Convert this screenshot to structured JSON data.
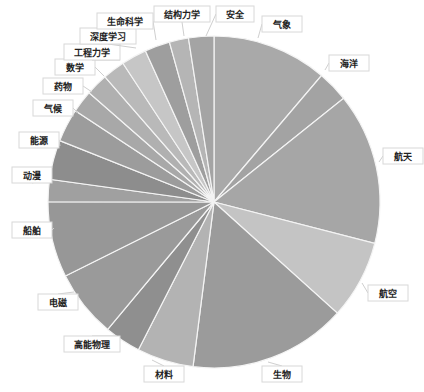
{
  "chart_data": {
    "type": "pie",
    "title": "",
    "start_angle_deg": 0,
    "direction": "clockwise",
    "legend": "none (callout labels)",
    "slices": [
      {
        "label": "气象",
        "value": 11.4,
        "color": "#a9a9a9"
      },
      {
        "label": "海洋",
        "value": 3.1,
        "color": "#a3a3a3"
      },
      {
        "label": "航天",
        "value": 15.0,
        "color": "#a6a6a6"
      },
      {
        "label": "航空",
        "value": 7.8,
        "color": "#c4c4c4"
      },
      {
        "label": "生物",
        "value": 15.6,
        "color": "#9b9b9b"
      },
      {
        "label": "材料",
        "value": 5.6,
        "color": "#b3b3b3"
      },
      {
        "label": "高能物理",
        "value": 3.6,
        "color": "#8f8f8f"
      },
      {
        "label": "电磁",
        "value": 6.7,
        "color": "#9a9a9a"
      },
      {
        "label": "船舶",
        "value": 7.5,
        "color": "#979797"
      },
      {
        "label": "动漫",
        "value": 2.2,
        "color": "#a0a0a0"
      },
      {
        "label": "能源",
        "value": 3.9,
        "color": "#8d8d8d"
      },
      {
        "label": "气候",
        "value": 3.3,
        "color": "#9c9c9c"
      },
      {
        "label": "药物",
        "value": 2.2,
        "color": "#a8a8a8"
      },
      {
        "label": "数学",
        "value": 2.2,
        "color": "#b0b0b0"
      },
      {
        "label": "工程力学",
        "value": 2.2,
        "color": "#b9b9b9"
      },
      {
        "label": "深度学习",
        "value": 2.5,
        "color": "#c6c6c6"
      },
      {
        "label": "生命科学",
        "value": 2.5,
        "color": "#9e9e9e"
      },
      {
        "label": "结构力学",
        "value": 1.9,
        "color": "#b5b5b5"
      },
      {
        "label": "安全",
        "value": 2.5,
        "color": "#a4a4a4"
      }
    ],
    "categories": [
      "气象",
      "海洋",
      "航天",
      "航空",
      "生物",
      "材料",
      "高能物理",
      "电磁",
      "船舶",
      "动漫",
      "能源",
      "气候",
      "药物",
      "数学",
      "工程力学",
      "深度学习",
      "生命科学",
      "结构力学",
      "安全"
    ],
    "values": [
      11.4,
      3.1,
      15.0,
      7.8,
      15.6,
      5.6,
      3.6,
      6.7,
      7.5,
      2.2,
      3.9,
      3.3,
      2.2,
      2.2,
      2.2,
      2.5,
      2.5,
      1.9,
      2.5
    ]
  },
  "labels": [
    {
      "text": "气象",
      "x": 262,
      "y": 16,
      "w": 40,
      "ax": 258,
      "ay": 38
    },
    {
      "text": "海洋",
      "x": 329,
      "y": 55,
      "w": 40,
      "ax": 325,
      "ay": 70
    },
    {
      "text": "航天",
      "x": 383,
      "y": 148,
      "w": 40,
      "ax": 379,
      "ay": 162
    },
    {
      "text": "航空",
      "x": 368,
      "y": 285,
      "w": 40,
      "ax": 362,
      "ay": 283
    },
    {
      "text": "生物",
      "x": 262,
      "y": 366,
      "w": 40,
      "ax": 268,
      "ay": 362
    },
    {
      "text": "材料",
      "x": 144,
      "y": 366,
      "w": 40,
      "ax": 152,
      "ay": 360
    },
    {
      "text": "高能物理",
      "x": 64,
      "y": 336,
      "w": 56,
      "ax": 116,
      "ay": 336
    },
    {
      "text": "电磁",
      "x": 38,
      "y": 294,
      "w": 40,
      "ax": 74,
      "ay": 292
    },
    {
      "text": "船舶",
      "x": 12,
      "y": 222,
      "w": 40,
      "ax": 54,
      "ay": 228
    },
    {
      "text": "动漫",
      "x": 12,
      "y": 167,
      "w": 40,
      "ax": 52,
      "ay": 178
    },
    {
      "text": "能源",
      "x": 19,
      "y": 132,
      "w": 40,
      "ax": 60,
      "ay": 146
    },
    {
      "text": "气候",
      "x": 33,
      "y": 100,
      "w": 40,
      "ax": 78,
      "ay": 113
    },
    {
      "text": "药物",
      "x": 43,
      "y": 78,
      "w": 40,
      "ax": 92,
      "ay": 92
    },
    {
      "text": "数学",
      "x": 55,
      "y": 59,
      "w": 40,
      "ax": 104,
      "ay": 76
    },
    {
      "text": "工程力学",
      "x": 64,
      "y": 44,
      "w": 56,
      "ax": 120,
      "ay": 60
    },
    {
      "text": "深度学习",
      "x": 80,
      "y": 28,
      "w": 56,
      "ax": 136,
      "ay": 48
    },
    {
      "text": "生命科学",
      "x": 97,
      "y": 13,
      "w": 56,
      "ax": 156,
      "ay": 40
    },
    {
      "text": "结构力学",
      "x": 154,
      "y": 6,
      "w": 56,
      "ax": 184,
      "ay": 36
    },
    {
      "text": "安全",
      "x": 216,
      "y": 6,
      "w": 38,
      "ax": 206,
      "ay": 36
    }
  ]
}
